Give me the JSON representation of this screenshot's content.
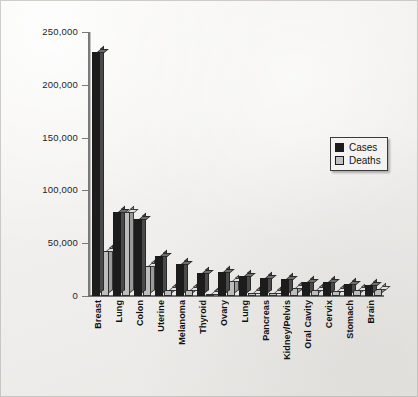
{
  "chart_data": {
    "type": "bar",
    "title": "",
    "subtitle": "",
    "xlabel": "",
    "ylabel": "",
    "ylim": [
      0,
      250000
    ],
    "yticks": [
      0,
      50000,
      100000,
      150000,
      200000,
      250000
    ],
    "ytick_labels": [
      "0",
      "50,000",
      "100,000",
      "150,000",
      "200,000",
      "250,000"
    ],
    "grid": false,
    "legend_position": "right",
    "categories": [
      "Breast",
      "Lung",
      "Colon",
      "Uterine",
      "Melanoma",
      "Thyroid",
      "Ovary",
      "Lung",
      "Pancreas",
      "Kidney/Pelvis",
      "Oral Cavity",
      "Cervix",
      "Stomach",
      "Brain"
    ],
    "series": [
      {
        "name": "Cases",
        "color": "#1c1c1c",
        "values": [
          231000,
          80000,
          73000,
          38000,
          30000,
          22000,
          23000,
          19000,
          17000,
          16000,
          13000,
          13000,
          11000,
          10000
        ]
      },
      {
        "name": "Deaths",
        "color": "#bdbdbd",
        "values": [
          43000,
          80000,
          28000,
          6000,
          6000,
          1200,
          14000,
          3000,
          2500,
          8000,
          6000,
          5000,
          5500,
          6500
        ]
      }
    ]
  },
  "legend": {
    "entries": [
      {
        "label": "Cases",
        "swatch": "cases"
      },
      {
        "label": "Deaths",
        "swatch": "deaths"
      }
    ]
  }
}
